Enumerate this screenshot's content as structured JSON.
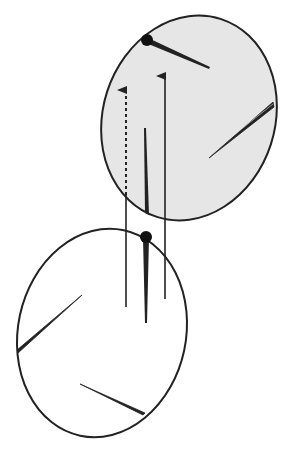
{
  "diagram": {
    "colors": {
      "upper_fill": "#e6e6e6",
      "stroke": "#222222",
      "lower_fill": "#ffffff",
      "background": "#ffffff"
    },
    "elements": {
      "upper_ellipse": {
        "label": "",
        "shaded": true
      },
      "lower_ellipse": {
        "label": "",
        "shaded": false
      },
      "arrows": [
        {
          "name": "left-arrow",
          "style": "dashed-inside-upper"
        },
        {
          "name": "right-arrow",
          "style": "solid"
        }
      ],
      "center_spike": {
        "style": "solid"
      }
    }
  }
}
